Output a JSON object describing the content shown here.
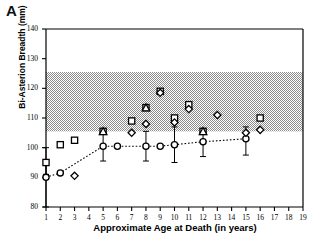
{
  "panel": {
    "label": "A"
  },
  "chart_data": {
    "type": "scatter",
    "title": "",
    "xlabel": "Approximate Age at Death (in years)",
    "ylabel": "Bi-Asterion Breadth (mm)",
    "xlim": [
      1,
      19
    ],
    "ylim": [
      80,
      140
    ],
    "xticks": [
      1,
      2,
      3,
      4,
      5,
      6,
      7,
      8,
      9,
      10,
      11,
      12,
      13,
      14,
      15,
      16,
      17,
      18,
      19
    ],
    "yticks": [
      80,
      90,
      100,
      110,
      120,
      130,
      140
    ],
    "grid": false,
    "legend": "none",
    "reference_band": {
      "label": "shaded reference range",
      "ymin": 105.5,
      "ymax": 125.5,
      "color": "#b4b4b4"
    },
    "series": [
      {
        "name": "Mean with range (open circle, dotted line)",
        "marker": "open-circle",
        "line": "dotted",
        "color": "#000000",
        "points": [
          {
            "x": 1,
            "y": 90.0,
            "low": 80.0,
            "high": 96.0
          },
          {
            "x": 2,
            "y": 91.5,
            "low": 91.5,
            "high": 91.5
          },
          {
            "x": 5,
            "y": 100.5,
            "low": 95.5,
            "high": 105.0
          },
          {
            "x": 6,
            "y": 100.5,
            "low": 100.5,
            "high": 100.5
          },
          {
            "x": 8,
            "y": 100.5,
            "low": 95.5,
            "high": 105.5
          },
          {
            "x": 9,
            "y": 100.5,
            "low": 100.5,
            "high": 100.5
          },
          {
            "x": 10,
            "y": 101.0,
            "low": 95.0,
            "high": 107.0
          },
          {
            "x": 12,
            "y": 102.0,
            "low": 97.0,
            "high": 105.0
          },
          {
            "x": 15,
            "y": 103.0,
            "low": 97.5,
            "high": 107.0
          }
        ]
      },
      {
        "name": "Open squares",
        "marker": "open-square",
        "color": "#000000",
        "points": [
          {
            "x": 1,
            "y": 95.0,
            "low": 91.0,
            "high": 100.0
          },
          {
            "x": 2,
            "y": 101.0
          },
          {
            "x": 3,
            "y": 102.5
          },
          {
            "x": 5,
            "y": 105.5
          },
          {
            "x": 7,
            "y": 109.0
          },
          {
            "x": 8,
            "y": 113.5
          },
          {
            "x": 9,
            "y": 119.0
          },
          {
            "x": 10,
            "y": 110.0
          },
          {
            "x": 11,
            "y": 114.5
          },
          {
            "x": 12,
            "y": 105.5
          },
          {
            "x": 16,
            "y": 110.0
          }
        ]
      },
      {
        "name": "Open diamonds",
        "marker": "open-diamond",
        "color": "#000000",
        "points": [
          {
            "x": 3,
            "y": 90.5
          },
          {
            "x": 7,
            "y": 105.0
          },
          {
            "x": 8,
            "y": 108.0
          },
          {
            "x": 9,
            "y": 118.5
          },
          {
            "x": 10,
            "y": 108.5
          },
          {
            "x": 11,
            "y": 113.0
          },
          {
            "x": 13,
            "y": 111.0
          },
          {
            "x": 15,
            "y": 105.0
          },
          {
            "x": 16,
            "y": 106.0
          }
        ]
      },
      {
        "name": "Open triangles",
        "marker": "open-triangle",
        "color": "#000000",
        "points": [
          {
            "x": 5,
            "y": 105.5
          },
          {
            "x": 8,
            "y": 113.5
          },
          {
            "x": 12,
            "y": 105.5
          }
        ]
      }
    ]
  }
}
